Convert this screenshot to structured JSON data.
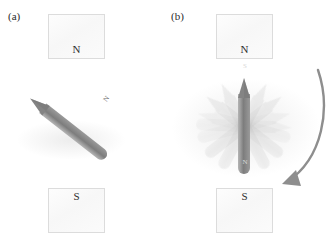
{
  "figure": {
    "background_color": "#ffffff",
    "width": 327,
    "height": 237
  },
  "panels": [
    {
      "id": "a",
      "label": "(a)",
      "label_x": 8,
      "label_y": 10,
      "poles": [
        {
          "id": "north",
          "letter": "N",
          "x": 48,
          "y": 14,
          "width": 57,
          "height": 45
        },
        {
          "id": "south",
          "letter": "S",
          "x": 48,
          "y": 188,
          "width": 57,
          "height": 45
        }
      ],
      "needle": {
        "id": "needle-a",
        "state": "misaligned",
        "angle_deg": 128,
        "center_x": 68,
        "center_y": 128,
        "length": 96,
        "width": 12,
        "pole_tip_label": "N",
        "pole_tail_label": "",
        "tip_position": "upper-right",
        "tail_shape": "rounded",
        "body_color": "#8b8b8b",
        "tip_color": "#848484"
      },
      "ghost_needles": []
    },
    {
      "id": "b",
      "label": "(b)",
      "label_x": 171,
      "label_y": 10,
      "poles": [
        {
          "id": "north",
          "letter": "N",
          "x": 216,
          "y": 14,
          "width": 57,
          "height": 45
        },
        {
          "id": "south",
          "letter": "S",
          "x": 216,
          "y": 188,
          "width": 57,
          "height": 45
        }
      ],
      "needle": {
        "id": "needle-b",
        "state": "aligned",
        "angle_deg": 180,
        "center_x": 244,
        "center_y": 126,
        "length": 96,
        "width": 12,
        "pole_tip_label": "N",
        "pole_tail_label": "S",
        "tip_position": "bottom",
        "tail_shape": "rounded",
        "body_color": "#7d7d7d",
        "tip_color": "#6f6f6f"
      },
      "ghost_needles": [
        {
          "angle_deg": 208,
          "opacity": 0.18
        },
        {
          "angle_deg": 232,
          "opacity": 0.16
        },
        {
          "angle_deg": 255,
          "opacity": 0.13
        },
        {
          "angle_deg": 152,
          "opacity": 0.18
        },
        {
          "angle_deg": 128,
          "opacity": 0.16
        },
        {
          "angle_deg": 105,
          "opacity": 0.12
        },
        {
          "angle_deg": 272,
          "opacity": 0.1
        }
      ],
      "rotation_arrow": {
        "id": "rotation-arrow",
        "direction": "clockwise",
        "color": "#8e8e8e",
        "start_x": 318,
        "start_y": 70,
        "end_x": 282,
        "end_y": 188,
        "arrowhead_points_to": "south-pole-box"
      }
    }
  ],
  "colors": {
    "needle_body": "#8b8b8b",
    "needle_tip": "#7d7d7d",
    "ghost_needle": "#bdbdbd",
    "arrow": "#8e8e8e",
    "box_fill": "#fafafa",
    "box_border": "#dcdcdc",
    "text": "#2e2e2e"
  }
}
